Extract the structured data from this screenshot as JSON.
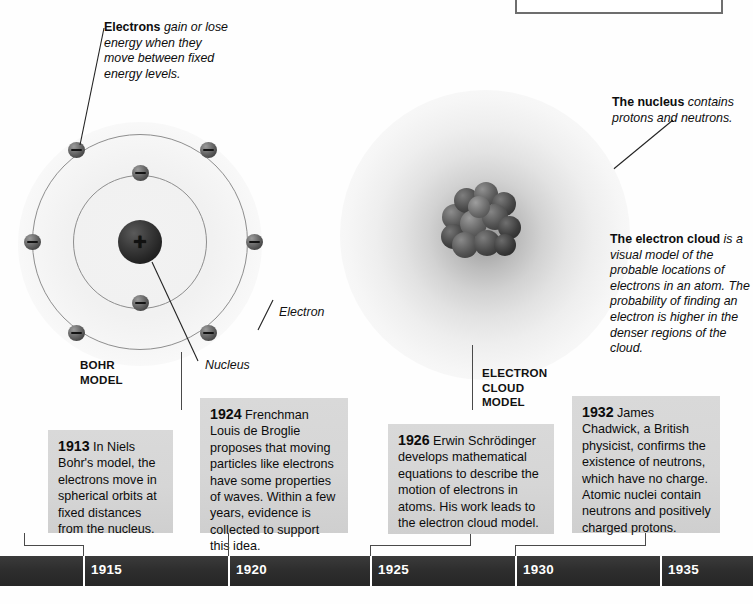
{
  "diagram": {
    "title_frame": {
      "present": true
    },
    "models": [
      {
        "id": "bohr",
        "label": "BOHR\nMODEL",
        "label_line1": "BOHR",
        "label_line2": "MODEL"
      },
      {
        "id": "electron-cloud",
        "label_line1": "ELECTRON",
        "label_line2": "CLOUD",
        "label_line3": "MODEL"
      }
    ],
    "callouts": [
      {
        "name": "electrons-energy-callout",
        "bold": "Electrons",
        "rest": " gain or lose energy when they move between fixed energy levels."
      },
      {
        "name": "nucleus-callout",
        "bold": "The nucleus",
        "rest": " contains protons and neutrons."
      },
      {
        "name": "electron-cloud-callout",
        "bold": "The electron cloud",
        "rest": " is a visual model of the probable locations of electrons in an atom. The probability of finding an electron is higher in the denser regions of the cloud."
      }
    ],
    "part_labels": [
      {
        "name": "electron-label",
        "text": "Electron"
      },
      {
        "name": "nucleus-label",
        "text": "Nucleus"
      }
    ],
    "bohr_atom": {
      "nucleus_charge": "+",
      "inner_shell_electrons": 2,
      "outer_shell_electrons": 6
    }
  },
  "timeline": {
    "years": [
      "1915",
      "1920",
      "1925",
      "1930",
      "1935"
    ],
    "events": [
      {
        "year": "1913",
        "text": " In Niels Bohr's model, the electrons move in spherical orbits at fixed distances from the nucleus."
      },
      {
        "year": "1924",
        "text": " Frenchman Louis de Broglie proposes that moving particles like electrons have some properties of waves. Within a few years, evidence is collected to support this idea."
      },
      {
        "year": "1926",
        "text": " Erwin Schrödinger develops mathematical equations to describe the motion of electrons in atoms. His work leads to the electron cloud model."
      },
      {
        "year": "1932",
        "text": " James Chadwick, a British physicist, confirms the existence of neutrons, which have no charge. Atomic nuclei contain neutrons and positively charged protons."
      }
    ]
  },
  "colors": {
    "timeline_bar": "#2e2e2e",
    "factbox": "#d7d7d7",
    "text": "#0c0c0c",
    "frame_border": "#6e6e6e"
  }
}
